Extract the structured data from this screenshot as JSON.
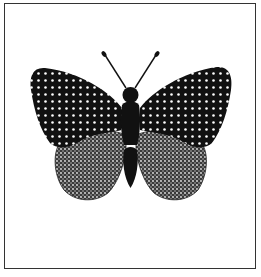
{
  "illustration": {
    "subject": "butterfly",
    "colors": {
      "background": "#ffffff",
      "frame": "#333333",
      "body": "#111111",
      "forewing": "#111111",
      "forewing_dots": "#ffffff",
      "hindwing": "#555555",
      "hindwing_texture": "#dddddd"
    },
    "parts": [
      "frame",
      "left-forewing",
      "right-forewing",
      "left-hindwing",
      "right-hindwing",
      "body",
      "head",
      "left-antenna",
      "right-antenna"
    ]
  }
}
